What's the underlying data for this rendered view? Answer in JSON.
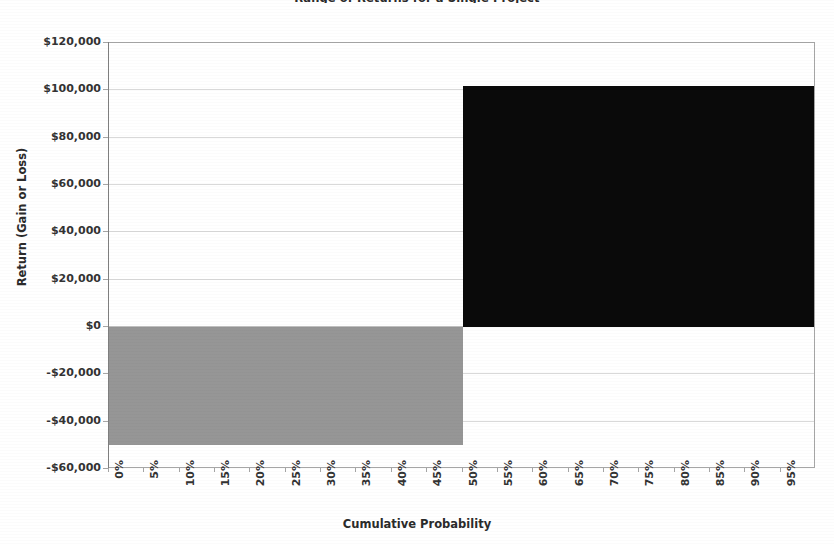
{
  "chart_data": {
    "type": "area",
    "title": "Range of Returns for a Single Project",
    "xlabel": "Cumulative Probability",
    "ylabel": "Return (Gain or Loss)",
    "grid": true,
    "legend": "none",
    "xlim": [
      0,
      100
    ],
    "ylim": [
      -60000,
      120000
    ],
    "y_ticks": [
      120000,
      100000,
      80000,
      60000,
      40000,
      20000,
      0,
      -20000,
      -40000,
      -60000
    ],
    "y_tick_labels": [
      "$120,000",
      "$100,000",
      "$80,000",
      "$60,000",
      "$40,000",
      "$20,000",
      "$0",
      "-$20,000",
      "-$40,000",
      "-$60,000"
    ],
    "x_ticks": [
      0,
      5,
      10,
      15,
      20,
      25,
      30,
      35,
      40,
      45,
      50,
      55,
      60,
      65,
      70,
      75,
      80,
      85,
      90,
      95
    ],
    "x_tick_labels": [
      "0%",
      "5%",
      "10%",
      "15%",
      "20%",
      "25%",
      "30%",
      "35%",
      "40%",
      "45%",
      "50%",
      "55%",
      "60%",
      "65%",
      "70%",
      "75%",
      "80%",
      "85%",
      "90%",
      "95%"
    ],
    "categories": [
      "0%",
      "5%",
      "10%",
      "15%",
      "20%",
      "25%",
      "30%",
      "35%",
      "40%",
      "45%",
      "50%",
      "55%",
      "60%",
      "65%",
      "70%",
      "75%",
      "80%",
      "85%",
      "90%",
      "95%"
    ],
    "series": [
      {
        "name": "Loss outcome",
        "color": "#969696",
        "x_range": [
          0,
          50
        ],
        "value": -50000,
        "values": [
          -50000,
          -50000,
          -50000,
          -50000,
          -50000,
          -50000,
          -50000,
          -50000,
          -50000,
          -50000,
          0,
          0,
          0,
          0,
          0,
          0,
          0,
          0,
          0,
          0
        ]
      },
      {
        "name": "Gain outcome",
        "color": "#0a0a0a",
        "x_range": [
          50,
          100
        ],
        "value": 102000,
        "values": [
          0,
          0,
          0,
          0,
          0,
          0,
          0,
          0,
          0,
          0,
          102000,
          102000,
          102000,
          102000,
          102000,
          102000,
          102000,
          102000,
          102000,
          102000
        ]
      }
    ],
    "annotations": []
  },
  "colors": {
    "loss": "#969696",
    "gain": "#0a0a0a",
    "gridline": "#d9d9d9",
    "axis": "#a6a6a6",
    "text": "#333333"
  }
}
